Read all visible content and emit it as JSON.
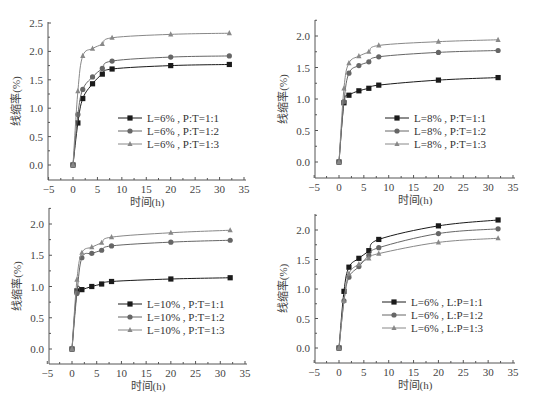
{
  "chart_data": [
    {
      "type": "line",
      "panel": "top-left",
      "title": "",
      "xlabel": "时间(h)",
      "ylabel": "线缩率(%)",
      "xlim": [
        -5,
        35
      ],
      "ylim": [
        -0.25,
        2.5
      ],
      "xticks": [
        -5,
        0,
        5,
        10,
        15,
        20,
        25,
        30,
        35
      ],
      "yticks": [
        "0.0",
        "0.5",
        "1.0",
        "1.5",
        "2.0",
        "2.5"
      ],
      "x": [
        0,
        1,
        2,
        4,
        6,
        8,
        20,
        32
      ],
      "series": [
        {
          "name": "L=6%, P:T=1:1",
          "marker": "square",
          "color": "#1a1a1a",
          "values": [
            0,
            0.74,
            1.17,
            1.43,
            1.6,
            1.69,
            1.75,
            1.77
          ]
        },
        {
          "name": "L=6%, P:T=1:2",
          "marker": "circle",
          "color": "#666666",
          "values": [
            0,
            0.89,
            1.33,
            1.55,
            1.7,
            1.83,
            1.9,
            1.92
          ]
        },
        {
          "name": "L=6%, P:T=1:3",
          "marker": "triangle",
          "color": "#888888",
          "values": [
            0,
            1.3,
            1.92,
            2.05,
            2.13,
            2.24,
            2.3,
            2.32
          ]
        }
      ],
      "legend_position": "center"
    },
    {
      "type": "line",
      "panel": "top-right",
      "title": "",
      "xlabel": "时间(h)",
      "ylabel": "线缩率(%)",
      "xlim": [
        -5,
        35
      ],
      "ylim": [
        -0.25,
        2.25
      ],
      "xticks": [
        -5,
        0,
        5,
        10,
        15,
        20,
        25,
        30,
        35
      ],
      "yticks": [
        "0.0",
        "0.5",
        "1.0",
        "1.5",
        "2.0"
      ],
      "x": [
        0,
        1,
        2,
        4,
        6,
        8,
        20,
        32
      ],
      "series": [
        {
          "name": "L=8%, P:T=1:1",
          "marker": "square",
          "color": "#1a1a1a",
          "values": [
            0,
            0.94,
            1.06,
            1.13,
            1.17,
            1.22,
            1.3,
            1.34
          ]
        },
        {
          "name": "L=8%, P:T=1:2",
          "marker": "circle",
          "color": "#666666",
          "values": [
            0,
            0.96,
            1.41,
            1.53,
            1.59,
            1.67,
            1.74,
            1.77
          ]
        },
        {
          "name": "L=8%, P:T=1:3",
          "marker": "triangle",
          "color": "#888888",
          "values": [
            0,
            1.17,
            1.57,
            1.68,
            1.75,
            1.85,
            1.91,
            1.94
          ]
        }
      ],
      "legend_position": "center"
    },
    {
      "type": "line",
      "panel": "bottom-left",
      "title": "",
      "xlabel": "时间(h)",
      "ylabel": "线缩率(%)",
      "xlim": [
        -5,
        35
      ],
      "ylim": [
        -0.25,
        2.25
      ],
      "xticks": [
        -5,
        0,
        5,
        10,
        15,
        20,
        25,
        30,
        35
      ],
      "yticks": [
        "0.0",
        "0.5",
        "1.0",
        "1.5",
        "2.0"
      ],
      "x": [
        0,
        1,
        2,
        4,
        6,
        8,
        20,
        32
      ],
      "series": [
        {
          "name": "L=10%, P:T=1:1",
          "marker": "square",
          "color": "#1a1a1a",
          "values": [
            0,
            0.93,
            0.95,
            1.0,
            1.04,
            1.08,
            1.12,
            1.14
          ]
        },
        {
          "name": "L=10%, P:T=1:2",
          "marker": "circle",
          "color": "#666666",
          "values": [
            0,
            0.89,
            1.46,
            1.53,
            1.58,
            1.65,
            1.71,
            1.74
          ]
        },
        {
          "name": "L=10%, P:T=1:3",
          "marker": "triangle",
          "color": "#888888",
          "values": [
            0,
            1.11,
            1.54,
            1.63,
            1.7,
            1.79,
            1.86,
            1.9
          ]
        }
      ],
      "legend_position": "center"
    },
    {
      "type": "line",
      "panel": "bottom-right",
      "title": "",
      "xlabel": "时间(h)",
      "ylabel": "线缩率(%)",
      "xlim": [
        -5,
        35
      ],
      "ylim": [
        -0.25,
        2.25
      ],
      "xticks": [
        -5,
        0,
        5,
        10,
        15,
        20,
        25,
        30,
        35
      ],
      "yticks": [
        "0.0",
        "0.5",
        "1.0",
        "1.5",
        "2.0"
      ],
      "x": [
        0,
        1,
        2,
        4,
        6,
        8,
        20,
        32
      ],
      "series": [
        {
          "name": "L=6%, L:P=1:1",
          "marker": "square",
          "color": "#1a1a1a",
          "values": [
            0,
            0.96,
            1.37,
            1.52,
            1.65,
            1.84,
            2.07,
            2.17
          ]
        },
        {
          "name": "L=6%, L:P=1:2",
          "marker": "circle",
          "color": "#666666",
          "values": [
            0,
            0.8,
            1.2,
            1.38,
            1.57,
            1.7,
            1.94,
            2.02
          ]
        },
        {
          "name": "L=6%, L:P=1:3",
          "marker": "triangle",
          "color": "#888888",
          "values": [
            0,
            0.8,
            1.26,
            1.42,
            1.52,
            1.6,
            1.79,
            1.86
          ]
        }
      ],
      "legend_position": "center"
    }
  ],
  "layout": {
    "panels": [
      {
        "axis_left": 48,
        "x0": 73,
        "x35": 244,
        "y0": 165,
        "yunit": 56.8,
        "axis_top": 22,
        "axis_bottom": 180,
        "legend_x": 118,
        "legend_y": 118
      },
      {
        "axis_left": 315,
        "x0": 339,
        "x35": 513,
        "y0": 162,
        "yunit": 63,
        "axis_top": 20,
        "axis_bottom": 178,
        "legend_x": 385,
        "legend_y": 118
      },
      {
        "axis_left": 49,
        "x0": 72,
        "x35": 245,
        "y0": 349,
        "yunit": 62.5,
        "axis_top": 208,
        "axis_bottom": 364,
        "legend_x": 118,
        "legend_y": 304
      },
      {
        "axis_left": 315,
        "x0": 339,
        "x35": 513,
        "y0": 348,
        "yunit": 59,
        "axis_top": 214,
        "axis_bottom": 363,
        "legend_x": 382,
        "legend_y": 302
      }
    ]
  }
}
